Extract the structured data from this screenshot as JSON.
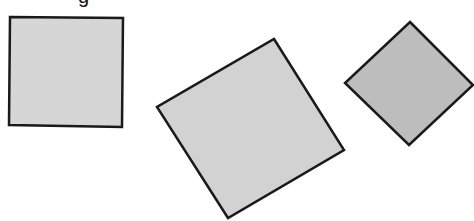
{
  "figure": {
    "caption_fragment": "g",
    "shapes": [
      {
        "id": "square-upright",
        "kind": "square",
        "orientation": "nearly upright",
        "fill": "#d6d6d6",
        "stroke": "#1a1a1a",
        "points": "10,17 123,18 122,127 9,125"
      },
      {
        "id": "square-tilted-large",
        "kind": "square",
        "orientation": "tilted about 30 degrees",
        "fill": "#d2d2d2",
        "stroke": "#1a1a1a",
        "points": "274,39 344,150 228,218 157,107"
      },
      {
        "id": "square-diamond",
        "kind": "square",
        "orientation": "tilted about 45 degrees",
        "fill": "#bdbdbd",
        "stroke": "#1a1a1a",
        "points": "410,22 473,85 409,145 345,83"
      }
    ]
  }
}
